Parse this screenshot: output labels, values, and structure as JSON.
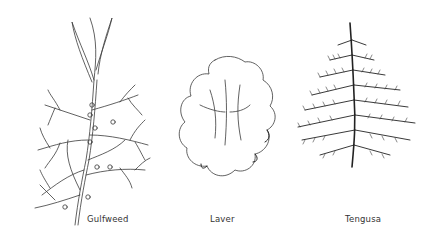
{
  "figures": [
    {
      "id": "gulfweed",
      "label": "Gulfweed",
      "icon": "gulfweed-seaweed-illustration"
    },
    {
      "id": "laver",
      "label": "Laver",
      "icon": "laver-seaweed-illustration"
    },
    {
      "id": "tengusa",
      "label": "Tengusa",
      "icon": "tengusa-seaweed-illustration"
    }
  ],
  "colors": {
    "background": "#ffffff",
    "ink": "#333333"
  }
}
